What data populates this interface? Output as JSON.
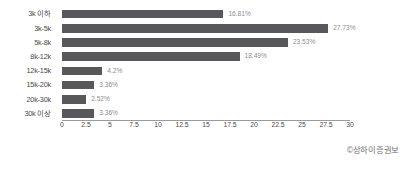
{
  "chart_data": {
    "type": "bar",
    "orientation": "horizontal",
    "title": "",
    "xlabel": "",
    "ylabel": "",
    "xlim": [
      0,
      30
    ],
    "grid": false,
    "legend": null,
    "value_suffix": "%",
    "categories": [
      "3k 이하",
      "3k-5k",
      "5k-8k",
      "8k-12k",
      "12k-15k",
      "15k-20k",
      "20k-30k",
      "30k 이상"
    ],
    "values": [
      16.81,
      27.73,
      23.53,
      18.49,
      4.2,
      3.36,
      2.52,
      3.36
    ],
    "value_labels": [
      "16.81%",
      "27.73%",
      "23.53%",
      "18.49%",
      "4.2%",
      "3.36%",
      "2.52%",
      "3.36%"
    ],
    "xticks": [
      0,
      2.5,
      5,
      7.5,
      10,
      12.5,
      15,
      17.5,
      20,
      22.5,
      25,
      27.5,
      30
    ],
    "xtick_labels": [
      "0",
      "2.5",
      "5",
      "7.5",
      "10",
      "12.5",
      "15",
      "17.5",
      "20",
      "22.5",
      "25",
      "27.5",
      "30"
    ],
    "bar_color": "#58585a",
    "value_label_color": "#8d8d8f",
    "axis_color": "#9a9a9a",
    "background": "#ffffff"
  },
  "watermark": {
    "text": "©상하이증권보"
  }
}
